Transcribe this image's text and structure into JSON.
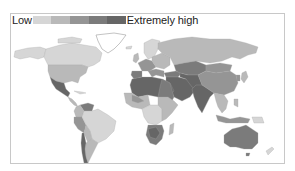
{
  "legend": {
    "low_label": "Low",
    "high_label": "Extremely high",
    "bins": [
      {
        "level": "Low",
        "color": "#d6d6d6"
      },
      {
        "level": "Low-medium",
        "color": "#b9b9b9"
      },
      {
        "level": "Medium-high",
        "color": "#959595"
      },
      {
        "level": "High",
        "color": "#7b7b7b"
      },
      {
        "level": "Extremely high",
        "color": "#666666"
      }
    ]
  },
  "map": {
    "type": "choropleth",
    "projection": "equirectangular-like world map",
    "no_data_color": "#ffffff",
    "outline_color": "#9a9a9a",
    "regions": [
      {
        "name": "Canada",
        "level": 1
      },
      {
        "name": "Alaska",
        "level": 1
      },
      {
        "name": "Greenland",
        "level": 0
      },
      {
        "name": "United States",
        "level": 2
      },
      {
        "name": "Mexico",
        "level": 5
      },
      {
        "name": "Central America",
        "level": 2
      },
      {
        "name": "Venezuela",
        "level": 4
      },
      {
        "name": "Colombia",
        "level": 2
      },
      {
        "name": "Peru",
        "level": 3
      },
      {
        "name": "Brazil",
        "level": 1
      },
      {
        "name": "Bolivia",
        "level": 2
      },
      {
        "name": "Chile",
        "level": 5
      },
      {
        "name": "Argentina",
        "level": 2
      },
      {
        "name": "Europe West",
        "level": 3
      },
      {
        "name": "Spain",
        "level": 4
      },
      {
        "name": "Scandinavia",
        "level": 1
      },
      {
        "name": "Eastern Europe",
        "level": 2
      },
      {
        "name": "Russia",
        "level": 2
      },
      {
        "name": "North Africa",
        "level": 5
      },
      {
        "name": "Middle East",
        "level": 5
      },
      {
        "name": "Central Asia",
        "level": 4
      },
      {
        "name": "India",
        "level": 5
      },
      {
        "name": "China",
        "level": 3
      },
      {
        "name": "Mongolia",
        "level": 3
      },
      {
        "name": "Southeast Asia",
        "level": 2
      },
      {
        "name": "West Africa",
        "level": 2
      },
      {
        "name": "Central Africa",
        "level": 1
      },
      {
        "name": "East Africa",
        "level": 2
      },
      {
        "name": "Southern Africa",
        "level": 4
      },
      {
        "name": "Madagascar",
        "level": 2
      },
      {
        "name": "Australia",
        "level": 4
      },
      {
        "name": "New Zealand",
        "level": 1
      },
      {
        "name": "Japan",
        "level": 2
      },
      {
        "name": "Indonesia",
        "level": 3
      }
    ]
  }
}
